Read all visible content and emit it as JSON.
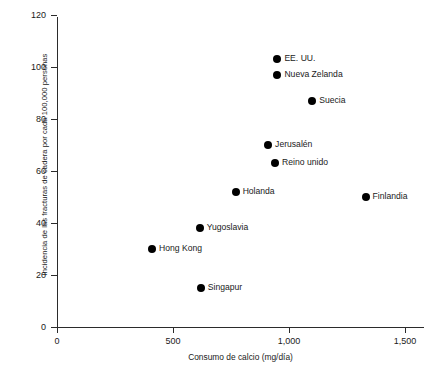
{
  "chart_data": {
    "type": "scatter",
    "title": "",
    "xlabel": "Consumo de calcio (mg/día)",
    "ylabel": "Incidencia de las fracturas de cadera por cada 100,000 personas",
    "xlim": [
      0,
      1580
    ],
    "ylim": [
      0,
      120
    ],
    "grid": false,
    "legend": "none",
    "xticks": [
      0,
      500,
      1000,
      1500
    ],
    "xticklabels": [
      "0",
      "500",
      "1,000",
      "1,500"
    ],
    "yticks": [
      0,
      20,
      40,
      60,
      80,
      100,
      120
    ],
    "yticklabels": [
      "0",
      "20",
      "40",
      "60",
      "80",
      "100",
      "120"
    ],
    "points": [
      {
        "label": "EE. UU.",
        "x": 950,
        "y": 103
      },
      {
        "label": "Nueva Zelanda",
        "x": 950,
        "y": 97
      },
      {
        "label": "Suecia",
        "x": 1100,
        "y": 87
      },
      {
        "label": "Jerusalén",
        "x": 910,
        "y": 70
      },
      {
        "label": "Reino unido",
        "x": 940,
        "y": 63
      },
      {
        "label": "Holanda",
        "x": 770,
        "y": 52
      },
      {
        "label": "Finlandia",
        "x": 1330,
        "y": 50
      },
      {
        "label": "Yugoslavia",
        "x": 615,
        "y": 38
      },
      {
        "label": "Hong Kong",
        "x": 410,
        "y": 30
      },
      {
        "label": "Singapur",
        "x": 620,
        "y": 15
      }
    ]
  },
  "colors": {
    "axis": "#2b2b2b",
    "point": "#000000",
    "text": "#1a1a1a",
    "background": "#ffffff"
  }
}
